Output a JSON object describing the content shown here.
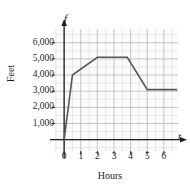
{
  "chart_data": {
    "type": "line",
    "title": "",
    "xlabel": "Hours",
    "ylabel": "Feet",
    "x_axis_name": "t",
    "y_axis_name": "f",
    "xlim": [
      -0.55,
      6.85
    ],
    "ylim": [
      -700,
      6850
    ],
    "xticks": [
      0,
      1,
      2,
      3,
      4,
      5,
      6
    ],
    "xtick_labels": [
      "0",
      "1",
      "2",
      "3",
      "4",
      "5",
      "6"
    ],
    "yticks": [
      1000,
      2000,
      3000,
      4000,
      5000,
      6000
    ],
    "ytick_labels": [
      "1,000",
      "2,000",
      "3,000",
      "4,000",
      "5,000",
      "6,000"
    ],
    "grid": true,
    "grid_major_step_x": 1,
    "grid_major_step_y": 1000,
    "grid_minor_divisions": 2,
    "legend": "none",
    "series": [
      {
        "name": "f",
        "x": [
          0,
          0.5,
          2,
          3.8,
          5,
          6.8
        ],
        "values": [
          0,
          4000,
          5100,
          5100,
          3100,
          3100
        ]
      }
    ],
    "colors": {
      "line": "#58585b",
      "axis": "#231f20",
      "grid_major": "#b8b8b8",
      "grid_minor": "#dcdcdc",
      "plot_background": "#fbfbfb",
      "text": "#231f20"
    }
  }
}
